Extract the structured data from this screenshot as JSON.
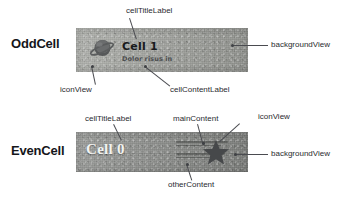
{
  "figure": {
    "background_color": "#ffffff"
  },
  "rows": [
    {
      "id": "odd",
      "caption": "OddCell",
      "cell": {
        "background_color": "#a6a8a3",
        "title_label": "Cell 1",
        "content_label": "Dolor risus in",
        "icon": "planet-icon",
        "icon_color": "#4f5153"
      },
      "annotations": [
        {
          "key": "cell_title_label",
          "label": "cellTitleLabel"
        },
        {
          "key": "background_view",
          "label": "backgroundView"
        },
        {
          "key": "icon_view",
          "label": "iconView"
        },
        {
          "key": "cell_content_label",
          "label": "cellContentLabel"
        }
      ]
    },
    {
      "id": "even",
      "caption": "EvenCell",
      "cell": {
        "background_color": "#8e908d",
        "title_label": "Cell 0",
        "main_content_placeholder": "",
        "other_content_placeholder": "",
        "icon": "star-icon",
        "icon_color": "#464849"
      },
      "annotations": [
        {
          "key": "cell_title_label",
          "label": "cellTitleLabel"
        },
        {
          "key": "main_content",
          "label": "mainContent"
        },
        {
          "key": "icon_view",
          "label": "iconView"
        },
        {
          "key": "background_view",
          "label": "backgroundView"
        },
        {
          "key": "other_content",
          "label": "otherContent"
        }
      ]
    }
  ],
  "colors": {
    "leader_line": "#4a4b50",
    "annotation_text": "#2a2b2f",
    "caption_text": "#15161a"
  }
}
